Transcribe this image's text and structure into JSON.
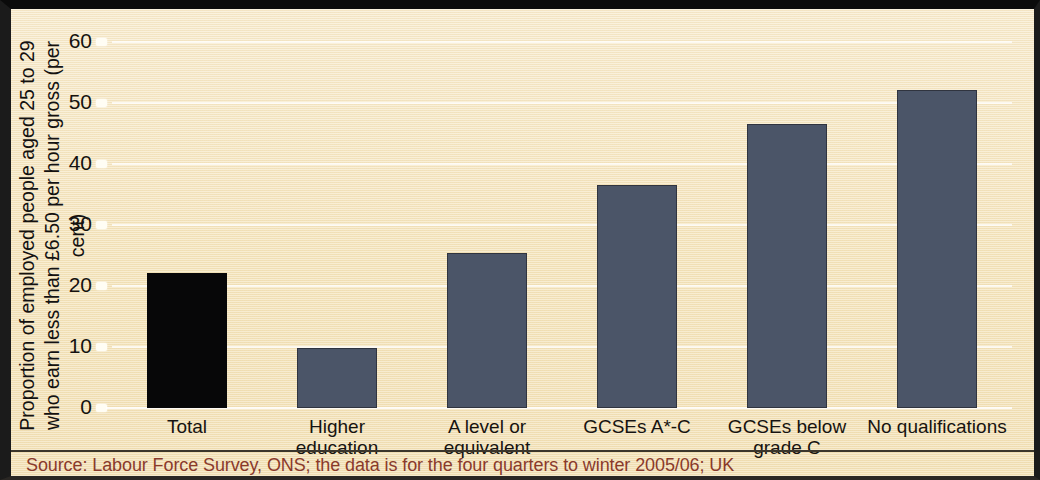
{
  "chart_data": {
    "type": "bar",
    "title": "",
    "subtitle": "",
    "xlabel": "",
    "ylabel": "Proportion of employed people aged 25 to 29\nwho earn less than £6.50 per hour gross (per cent)",
    "categories": [
      "Total",
      "Higher\neducation",
      "A level or\nequivalent",
      "GCSEs A*-C",
      "GCSEs below\ngrade C",
      "No qualifications"
    ],
    "values": [
      22.2,
      9.8,
      25.4,
      36.6,
      46.5,
      52.2
    ],
    "ylim": [
      0,
      60
    ],
    "yticks": [
      0,
      10,
      20,
      30,
      40,
      50,
      60
    ],
    "ytick_labels": [
      "0",
      "10",
      "20",
      "30",
      "40",
      "50",
      "60"
    ],
    "grid": true,
    "legend": false,
    "bar_colors": [
      "#070708",
      "#4b5568",
      "#4b5568",
      "#4b5568",
      "#4b5568",
      "#4b5568"
    ],
    "highlight_index": 0,
    "source": "Source: Labour Force Survey, ONS; the data is for the four quarters to winter 2005/06; UK"
  },
  "colors": {
    "background": "#f5e5bd",
    "accent_bar": "#070708",
    "bar": "#4b5568",
    "source_text": "#8a3a2b",
    "grid": "#ffffff",
    "frame": "#1b1b1b"
  }
}
